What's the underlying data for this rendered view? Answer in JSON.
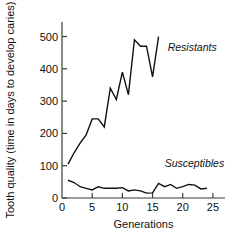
{
  "chart_data": {
    "type": "line",
    "title": "",
    "xlabel": "Generations",
    "ylabel": "Tooth quality (time in days to develop caries)",
    "xlim": [
      0,
      27
    ],
    "ylim": [
      0,
      545
    ],
    "xticks": [
      0,
      5,
      10,
      15,
      20,
      25
    ],
    "yticks": [
      0,
      100,
      200,
      300,
      400,
      500
    ],
    "xtick_labels": [
      "0",
      "5",
      "10",
      "15",
      "20",
      "25"
    ],
    "ytick_labels": [
      "0",
      "100",
      "200",
      "300",
      "400",
      "500"
    ],
    "grid": false,
    "legend_position": "inline-annotation",
    "line_color": "#111111",
    "axis_color": "#3a3a3a",
    "background": "#ffffff",
    "series": [
      {
        "name": "Resistants",
        "label_x": 17.5,
        "label_y": 455,
        "x": [
          1,
          2,
          3,
          4,
          5,
          6,
          7,
          8,
          9,
          10,
          11,
          12,
          13,
          14,
          15,
          16
        ],
        "values": [
          105,
          140,
          170,
          195,
          245,
          245,
          220,
          340,
          305,
          390,
          320,
          490,
          470,
          470,
          375,
          500
        ]
      },
      {
        "name": "Susceptibles",
        "label_x": 17.0,
        "label_y": 95,
        "x": [
          1,
          2,
          3,
          4,
          5,
          6,
          7,
          8,
          9,
          10,
          11,
          12,
          13,
          14,
          15,
          16,
          17,
          18,
          19,
          20,
          21,
          22,
          23,
          24
        ],
        "values": [
          55,
          48,
          35,
          30,
          25,
          35,
          30,
          30,
          30,
          32,
          22,
          25,
          22,
          15,
          16,
          45,
          35,
          42,
          30,
          35,
          42,
          40,
          28,
          30
        ]
      }
    ]
  }
}
